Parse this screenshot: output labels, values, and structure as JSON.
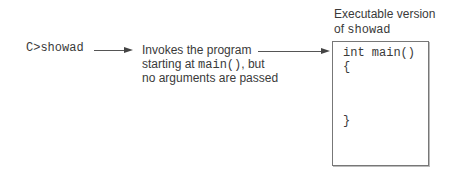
{
  "command": {
    "text": "C>showad"
  },
  "description": {
    "line1": "Invokes the program",
    "line2_prefix": "starting at ",
    "line2_code": "main()",
    "line2_suffix": ", but",
    "line3": "no arguments are passed"
  },
  "executable": {
    "label_line1": "Executable version",
    "label_line2_prefix": "of ",
    "label_line2_code": "showad",
    "code_lines": [
      "int main()",
      "{",
      "}"
    ]
  },
  "colors": {
    "text": "#3a3a3a",
    "line": "#555555",
    "box_border": "#777777"
  }
}
